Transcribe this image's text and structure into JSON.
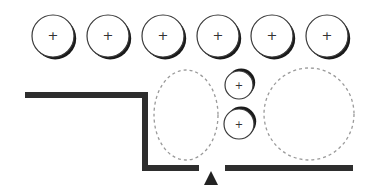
{
  "diagram": {
    "width": 367,
    "height": 193,
    "colors": {
      "background": "#ffffff",
      "wall": "#2e2e2e",
      "outline": "#3a3a3a",
      "shadow": "#1a1a1a",
      "dashed": "#9a9a9a",
      "marker": "#222222"
    },
    "top_row_circles": [
      {
        "cx": 53,
        "cy": 36,
        "r": 21,
        "symbol": "+"
      },
      {
        "cx": 108,
        "cy": 36,
        "r": 21,
        "symbol": "+"
      },
      {
        "cx": 163,
        "cy": 36,
        "r": 21,
        "symbol": "+"
      },
      {
        "cx": 218,
        "cy": 36,
        "r": 21,
        "symbol": "+"
      },
      {
        "cx": 272,
        "cy": 36,
        "r": 21,
        "symbol": "+"
      },
      {
        "cx": 327,
        "cy": 36,
        "r": 21,
        "symbol": "+"
      }
    ],
    "small_circles": [
      {
        "cx": 239,
        "cy": 85,
        "r": 14,
        "symbol": "+"
      },
      {
        "cx": 239,
        "cy": 124,
        "r": 15,
        "symbol": "+"
      }
    ],
    "dashed_shapes": [
      {
        "type": "ellipse",
        "cx": 186,
        "cy": 115,
        "rx": 32,
        "ry": 45
      },
      {
        "type": "circle",
        "cx": 309,
        "cy": 114,
        "rx": 45,
        "ry": 46
      }
    ],
    "walls": [
      {
        "points": "25,95 145,95 145,168 199,168"
      },
      {
        "points": "225,168 353,168"
      }
    ],
    "marker": {
      "shape": "triangle-up",
      "points": "211,171 204,185 218,185"
    }
  }
}
